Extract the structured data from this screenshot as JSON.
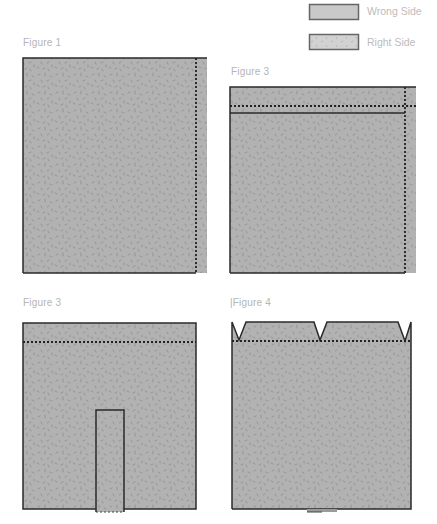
{
  "legend": {
    "items": [
      {
        "label": "Wrong Side",
        "swatch": "plain",
        "color": "#c9c9c9"
      },
      {
        "label": "Right Side",
        "swatch": "speckled",
        "color": "#d2d2d2"
      }
    ]
  },
  "figures": [
    {
      "id": "fig1",
      "label": "Figure 1",
      "lines": [
        "vertical-dotted-right"
      ]
    },
    {
      "id": "fig2",
      "label": "Figure 3",
      "lines": [
        "horizontal-dotted-top",
        "horizontal-solid-top",
        "vertical-dotted-right"
      ]
    },
    {
      "id": "fig3",
      "label": "Figure 3",
      "lines": [
        "horizontal-dotted-top",
        "inner-rectangle-bottom-center"
      ]
    },
    {
      "id": "fig4",
      "label": "|Figure 4",
      "lines": [
        "horizontal-dotted-top",
        "v-notches-top",
        "small-tab-bottom"
      ]
    }
  ],
  "colors": {
    "fabric": "#b2b2b2",
    "speckle": "#8a8a8a",
    "outline": "#2a2a2a",
    "stitch": "#222222",
    "label_text": "#b5b5b5"
  }
}
